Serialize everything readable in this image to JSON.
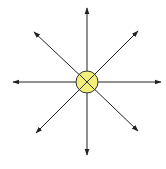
{
  "diagram": {
    "center": {
      "x": 87,
      "y": 82,
      "radius": 11,
      "fill": "#f2ee7a",
      "stroke": "#333333",
      "symbol": "cross-x"
    },
    "arrow_color": "#222222",
    "arrows": [
      {
        "direction": "north",
        "x2": 87,
        "y2": 8
      },
      {
        "direction": "north-east",
        "x2": 138,
        "y2": 31
      },
      {
        "direction": "east",
        "x2": 161,
        "y2": 82
      },
      {
        "direction": "south-east",
        "x2": 138,
        "y2": 131
      },
      {
        "direction": "south",
        "x2": 87,
        "y2": 155
      },
      {
        "direction": "south-west",
        "x2": 36,
        "y2": 133
      },
      {
        "direction": "west",
        "x2": 13,
        "y2": 82
      },
      {
        "direction": "north-west",
        "x2": 34,
        "y2": 32
      }
    ]
  }
}
